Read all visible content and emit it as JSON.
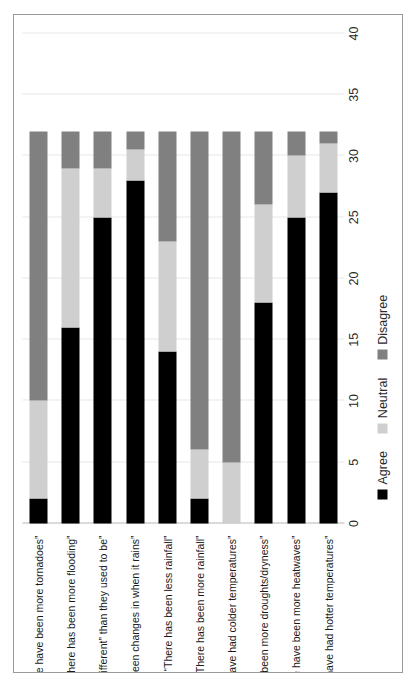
{
  "chart_data": {
    "type": "bar",
    "orientation": "horizontal-stacked",
    "title": "",
    "xlabel": "",
    "ylabel": "",
    "xlim": [
      0,
      40
    ],
    "xticks": [
      0,
      5,
      10,
      15,
      20,
      25,
      30,
      35,
      40
    ],
    "grid": true,
    "legend_position": "bottom",
    "stacked": true,
    "categories": [
      "“There have been more tornadoes”",
      "“There has been more flooding”",
      "“The rains are “different” than they used to be”",
      "“There have been changes in when it rains”",
      "“There has been less rainfall”",
      "“There has been more rainfall”",
      "“We have had colder temperatures”",
      "“There has been more droughts/dryness”",
      "“There have been more heatwaves”",
      "“We have had hotter temperatures”"
    ],
    "series": [
      {
        "name": "Agree",
        "color": "#000000",
        "values": [
          2,
          16,
          25,
          28,
          14,
          2,
          0,
          18,
          25,
          27
        ]
      },
      {
        "name": "Neutral",
        "color": "#cfcfcf",
        "values": [
          8,
          13,
          4,
          2.5,
          9,
          4,
          5,
          8,
          5,
          4
        ]
      },
      {
        "name": "Disagree",
        "color": "#808080",
        "values": [
          22,
          3,
          3,
          1.5,
          9,
          26,
          27,
          6,
          2,
          1
        ]
      }
    ],
    "totals": [
      32,
      32,
      32,
      32,
      32,
      32,
      32,
      32,
      32,
      32
    ]
  },
  "legend": {
    "items": [
      {
        "label": "Agree",
        "swatch": "agree"
      },
      {
        "label": "Neutral",
        "swatch": "neutral"
      },
      {
        "label": "Disagree",
        "swatch": "disagree"
      }
    ]
  },
  "colors": {
    "agree": "#000000",
    "neutral": "#cfcfcf",
    "disagree": "#808080",
    "gridline": "#e8e8e8",
    "frame": "#9a9a9a"
  }
}
